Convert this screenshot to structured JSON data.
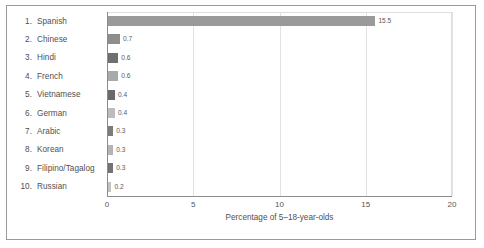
{
  "chart_data": {
    "type": "bar",
    "orientation": "horizontal",
    "title": "",
    "xlabel": "Percentage of 5–18-year-olds",
    "ylabel": "",
    "xlim": [
      0,
      20
    ],
    "xticks": [
      "0",
      "5",
      "10",
      "15",
      "20"
    ],
    "xtick_values": [
      0,
      5,
      10,
      15,
      20
    ],
    "grid": true,
    "grid_axis": "x",
    "legend": "none",
    "categories": [
      "Spanish",
      "Chinese",
      "Hindi",
      "French",
      "Vietnamese",
      "German",
      "Arabic",
      "Korean",
      "Filipino/Tagalog",
      "Russian"
    ],
    "ranks": [
      "1.",
      "2.",
      "3.",
      "4.",
      "5.",
      "6.",
      "7.",
      "8.",
      "9.",
      "10."
    ],
    "values": [
      15.5,
      0.7,
      0.6,
      0.6,
      0.4,
      0.4,
      0.3,
      0.3,
      0.3,
      0.2
    ],
    "value_labels": [
      "15.5",
      "0.7",
      "0.6",
      "0.6",
      "0.4",
      "0.4",
      "0.3",
      "0.3",
      "0.3",
      "0.2"
    ],
    "bar_colors": [
      "#9a9a9a",
      "#8e8e8e",
      "#6f6f6f",
      "#a9a9a9",
      "#6a6a6a",
      "#bdbdbd",
      "#7b7b7b",
      "#b4b4b4",
      "#747474",
      "#c2c2c2"
    ]
  },
  "colors": {
    "frame_border": "#9a9a9a",
    "axis": "#8c8c8c",
    "gridline": "#e2e2e2",
    "text": "#4f4f4f",
    "background": "#ffffff"
  }
}
